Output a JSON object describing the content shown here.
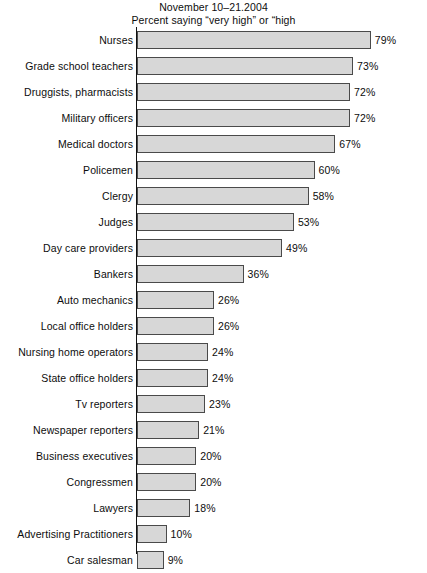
{
  "chart_data": {
    "type": "bar",
    "orientation": "horizontal",
    "title": "November 10–21.2004",
    "subtitle": "Percent saying “very high” or “high",
    "xlabel": "",
    "ylabel": "",
    "xlim": [
      0,
      100
    ],
    "grid": false,
    "legend": false,
    "value_suffix": "%",
    "categories": [
      "Nurses",
      "Grade school teachers",
      "Druggists, pharmacists",
      "Military officers",
      "Medical doctors",
      "Policemen",
      "Clergy",
      "Judges",
      "Day care providers",
      "Bankers",
      "Auto mechanics",
      "Local office holders",
      "Nursing home operators",
      "State office holders",
      "Tv reporters",
      "Newspaper reporters",
      "Business executives",
      "Congressmen",
      "Lawyers",
      "Advertising Practitioners",
      "Car salesman"
    ],
    "values": [
      79,
      73,
      72,
      72,
      67,
      60,
      58,
      53,
      49,
      36,
      26,
      26,
      24,
      24,
      23,
      21,
      20,
      20,
      18,
      10,
      9
    ],
    "value_labels": [
      "79%",
      "73%",
      "72%",
      "72%",
      "67%",
      "60%",
      "58%",
      "53%",
      "49%",
      "36%",
      "26%",
      "26%",
      "24%",
      "24%",
      "23%",
      "21%",
      "20%",
      "20%",
      "18%",
      "10%",
      "9%"
    ],
    "colors": {
      "bar_fill": "#d7d7d7",
      "bar_border": "#4a4a4a",
      "axis": "#111111",
      "text": "#0d0d0d",
      "background": "#ffffff"
    },
    "px_per_percent": 2.96
  }
}
